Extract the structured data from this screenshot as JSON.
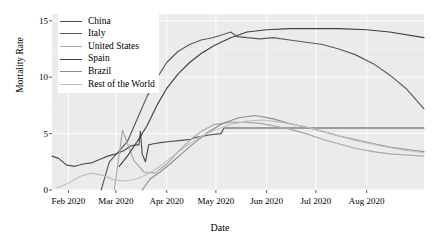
{
  "chart_data": {
    "type": "line",
    "title": "",
    "xlabel": "Date",
    "ylabel": "Mortality Rate",
    "xlim": [
      "2020-01-22",
      "2020-09-05"
    ],
    "ylim": [
      0,
      15.6
    ],
    "yticks": [
      0,
      5,
      10,
      15
    ],
    "ytick_labels": [
      "0",
      "5",
      "10",
      "15"
    ],
    "xticks": [
      "Feb 2020",
      "Mar 2020",
      "Apr 2020",
      "May 2020",
      "Jun 2020",
      "Jul 2020",
      "Aug 2020"
    ],
    "grid": true,
    "grid_color": "#ffffff",
    "panel_background": "#ebebeb",
    "legend_position": "top-left",
    "legend_entries": [
      "China",
      "Italy",
      "United States",
      "Spain",
      "Brazil",
      "Rest of the World"
    ],
    "series": [
      {
        "name": "China",
        "color": "#4d4d4d",
        "x": [
          "2020-01-22",
          "2020-01-26",
          "2020-01-31",
          "2020-02-05",
          "2020-02-10",
          "2020-02-15",
          "2020-02-20",
          "2020-02-25",
          "2020-03-01",
          "2020-03-06",
          "2020-03-10",
          "2020-03-13",
          "2020-03-15",
          "2020-03-16",
          "2020-03-17",
          "2020-03-19",
          "2020-03-21",
          "2020-03-24",
          "2020-03-28",
          "2020-04-03",
          "2020-04-10",
          "2020-04-16",
          "2020-04-17",
          "2020-04-20",
          "2020-04-28",
          "2020-05-04",
          "2020-05-06",
          "2020-05-20",
          "2020-06-15",
          "2020-07-15",
          "2020-08-15",
          "2020-09-05"
        ],
        "y": [
          3.0,
          2.8,
          2.2,
          2.1,
          2.3,
          2.4,
          2.7,
          3.0,
          3.2,
          3.5,
          3.9,
          4.0,
          4.0,
          5.2,
          3.2,
          2.5,
          4.0,
          4.1,
          4.2,
          4.3,
          4.4,
          4.5,
          4.6,
          4.7,
          4.9,
          5.0,
          5.5,
          5.5,
          5.5,
          5.5,
          5.5,
          5.5
        ]
      },
      {
        "name": "Italy",
        "color": "#595959",
        "x": [
          "2020-02-21",
          "2020-02-26",
          "2020-03-02",
          "2020-03-08",
          "2020-03-14",
          "2020-03-20",
          "2020-03-26",
          "2020-04-01",
          "2020-04-08",
          "2020-04-15",
          "2020-04-22",
          "2020-04-29",
          "2020-05-06",
          "2020-05-10",
          "2020-05-14",
          "2020-05-20",
          "2020-05-28",
          "2020-06-05",
          "2020-06-15",
          "2020-06-25",
          "2020-07-05",
          "2020-07-15",
          "2020-07-25",
          "2020-08-05",
          "2020-08-15",
          "2020-08-25",
          "2020-09-05"
        ],
        "y": [
          0.0,
          2.5,
          3.3,
          4.3,
          6.3,
          8.3,
          9.9,
          11.3,
          12.3,
          12.9,
          13.3,
          13.5,
          13.8,
          14.0,
          13.6,
          13.5,
          13.4,
          13.5,
          13.3,
          13.1,
          12.9,
          12.5,
          12.0,
          11.2,
          10.2,
          9.0,
          7.2
        ]
      },
      {
        "name": "United States",
        "color": "#a6a6a6",
        "x": [
          "2020-02-29",
          "2020-03-05",
          "2020-03-12",
          "2020-03-18",
          "2020-03-25",
          "2020-04-01",
          "2020-04-08",
          "2020-04-15",
          "2020-04-22",
          "2020-04-30",
          "2020-05-10",
          "2020-05-20",
          "2020-05-28",
          "2020-06-05",
          "2020-06-15",
          "2020-06-25",
          "2020-07-05",
          "2020-07-15",
          "2020-07-25",
          "2020-08-05",
          "2020-08-15",
          "2020-08-25",
          "2020-09-05"
        ],
        "y": [
          0.0,
          5.3,
          2.6,
          1.6,
          1.5,
          2.3,
          3.4,
          4.4,
          5.2,
          5.8,
          6.0,
          6.0,
          5.9,
          5.7,
          5.4,
          5.0,
          4.5,
          4.1,
          3.7,
          3.4,
          3.2,
          3.1,
          3.0
        ]
      },
      {
        "name": "Spain",
        "color": "#404040",
        "x": [
          "2020-03-03",
          "2020-03-08",
          "2020-03-14",
          "2020-03-20",
          "2020-03-26",
          "2020-04-01",
          "2020-04-08",
          "2020-04-15",
          "2020-04-22",
          "2020-04-30",
          "2020-05-10",
          "2020-05-20",
          "2020-06-01",
          "2020-06-15",
          "2020-07-01",
          "2020-07-15",
          "2020-08-01",
          "2020-08-15",
          "2020-09-05"
        ],
        "y": [
          2.1,
          3.0,
          4.3,
          5.7,
          7.5,
          9.0,
          10.3,
          11.3,
          12.1,
          12.8,
          13.5,
          14.0,
          14.2,
          14.3,
          14.3,
          14.3,
          14.2,
          14.0,
          13.5
        ]
      },
      {
        "name": "Brazil",
        "color": "#8c8c8c",
        "x": [
          "2020-03-17",
          "2020-03-22",
          "2020-03-28",
          "2020-04-03",
          "2020-04-10",
          "2020-04-18",
          "2020-04-26",
          "2020-05-05",
          "2020-05-15",
          "2020-05-25",
          "2020-06-05",
          "2020-06-15",
          "2020-06-30",
          "2020-07-15",
          "2020-07-30",
          "2020-08-15",
          "2020-08-30",
          "2020-09-05"
        ],
        "y": [
          0.0,
          1.0,
          1.6,
          2.3,
          3.2,
          4.2,
          5.1,
          5.9,
          6.4,
          6.6,
          6.3,
          5.9,
          5.4,
          4.8,
          4.3,
          3.8,
          3.5,
          3.4
        ]
      },
      {
        "name": "Rest of the World",
        "color": "#bfbfbf",
        "x": [
          "2020-01-25",
          "2020-02-01",
          "2020-02-08",
          "2020-02-15",
          "2020-02-22",
          "2020-02-29",
          "2020-03-07",
          "2020-03-14",
          "2020-03-20",
          "2020-03-27",
          "2020-04-03",
          "2020-04-12",
          "2020-04-20",
          "2020-04-30",
          "2020-05-10",
          "2020-05-20",
          "2020-05-30",
          "2020-06-10",
          "2020-06-25",
          "2020-07-10",
          "2020-07-25",
          "2020-08-10",
          "2020-08-25",
          "2020-09-05"
        ],
        "y": [
          0.2,
          0.6,
          1.2,
          1.5,
          1.3,
          0.9,
          0.8,
          1.0,
          1.4,
          2.0,
          2.8,
          3.8,
          4.6,
          5.3,
          5.8,
          6.1,
          6.2,
          6.0,
          5.6,
          5.0,
          4.4,
          3.9,
          3.5,
          3.3
        ]
      }
    ]
  }
}
